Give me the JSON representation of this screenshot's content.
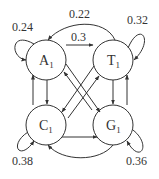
{
  "diagram": {
    "type": "state-transition",
    "nodes": [
      {
        "id": "A",
        "label": "A",
        "sub": "1"
      },
      {
        "id": "T",
        "label": "T",
        "sub": "1"
      },
      {
        "id": "C",
        "label": "C",
        "sub": "1"
      },
      {
        "id": "G",
        "label": "G",
        "sub": "1"
      }
    ],
    "edge_labels": {
      "A_self": "0.24",
      "T_self": "0.32",
      "C_self": "0.38",
      "G_self": "0.36",
      "T_to_A": "0.22",
      "A_to_T": "0.3"
    },
    "colors": {
      "stroke": "#333333",
      "background": "#ffffff"
    }
  }
}
